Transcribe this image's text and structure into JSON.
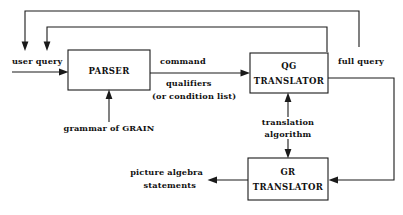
{
  "diagram": {
    "background_color": "#ffffff",
    "stroke_color": "#1a1a1a",
    "text_color": "#111111",
    "width": 403,
    "height": 215,
    "nodes": [
      {
        "id": "parser",
        "line1": "PARSER",
        "line2": "",
        "x": 68,
        "y": 50,
        "w": 82,
        "h": 40
      },
      {
        "id": "qg-translator",
        "line1": "QG",
        "line2": "TRANSLATOR",
        "x": 250,
        "y": 53,
        "w": 78,
        "h": 40
      },
      {
        "id": "gr-translator",
        "line1": "GR",
        "line2": "TRANSLATOR",
        "x": 248,
        "y": 158,
        "w": 80,
        "h": 42
      }
    ],
    "labels": {
      "user_query": "user query",
      "command": "command",
      "qualifiers": "qualifiers",
      "condition_list": "(or condition list)",
      "grammar_of_grain": "grammar of GRAIN",
      "full_query": "full query",
      "translation": "translation",
      "algorithm": "algorithm",
      "picture_algebra": "picture algebra",
      "statements": "statements"
    },
    "edges": [
      {
        "id": "user-query-in",
        "from": "external-input",
        "to": "parser",
        "label": "user query"
      },
      {
        "id": "parser-to-qg",
        "from": "parser",
        "to": "qg-translator",
        "label": "command / qualifiers (or condition list)"
      },
      {
        "id": "grammar-in",
        "from": "grammar-of-grain",
        "to": "parser",
        "label": "grammar of GRAIN"
      },
      {
        "id": "translation-alg-up",
        "from": "translation-algorithm",
        "to": "qg-translator",
        "label": "translation algorithm"
      },
      {
        "id": "translation-alg-down",
        "from": "translation-algorithm",
        "to": "gr-translator",
        "label": "translation algorithm"
      },
      {
        "id": "full-query-feedback",
        "from": "qg-translator",
        "to": "gr-translator",
        "label": "full query"
      },
      {
        "id": "gr-output",
        "from": "gr-translator",
        "to": "external-output",
        "label": "picture algebra statements"
      },
      {
        "id": "outer-feedback-loop",
        "from": "qg-translator",
        "to": "parser-top-left",
        "label": ""
      },
      {
        "id": "inner-feedback-loop",
        "from": "qg-translator",
        "to": "parser-top",
        "label": ""
      }
    ]
  }
}
